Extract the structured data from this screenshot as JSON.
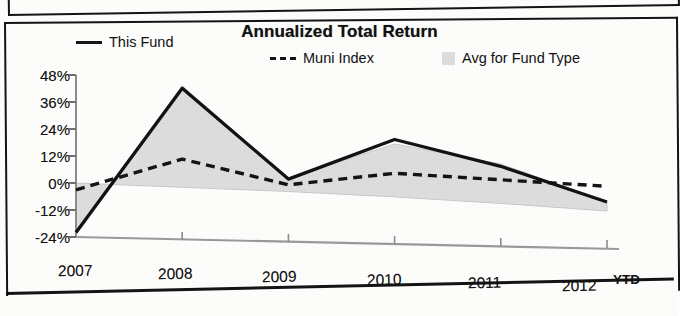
{
  "document": {
    "upper_panel_edge": "partial-panel-border-above",
    "scan_artifact": "photocopied-page"
  },
  "chart_data": {
    "type": "line",
    "title": "Annualized Total Return",
    "xlabel": "",
    "ylabel": "",
    "x": [
      "2007",
      "2008",
      "2009",
      "2010",
      "2011",
      "2012"
    ],
    "x_suffix": "YTD",
    "ylim": [
      -24,
      48
    ],
    "yticks": [
      48,
      36,
      24,
      12,
      0,
      -12,
      -24
    ],
    "ytick_labels": [
      "48%",
      "36%",
      "24%",
      "12%",
      "0%",
      "-12%",
      "-24%"
    ],
    "grid": false,
    "legend_position": "top",
    "series": [
      {
        "name": "This Fund",
        "style": "solid",
        "color": "#151515",
        "values": [
          -22,
          43,
          3.5,
          22,
          11,
          -4
        ]
      },
      {
        "name": "Muni Index",
        "style": "dashed",
        "color": "#151515",
        "values": [
          -3,
          11.5,
          1,
          7,
          5,
          3
        ]
      },
      {
        "name": "Avg for Fund Type",
        "style": "area",
        "color": "#d9d9d9",
        "values": [
          -22,
          44,
          4,
          20,
          12,
          -4
        ],
        "baseline": [
          0,
          -1,
          -2,
          -3.5,
          -5.5,
          -8
        ]
      }
    ]
  },
  "axis": {
    "ytick_labels": [
      "48%",
      "36%",
      "24%",
      "12%",
      "0%",
      "-12%",
      "-24%"
    ],
    "xtick_labels": [
      "2007",
      "2008",
      "2009",
      "2010",
      "2011",
      "2012"
    ],
    "ytd": "YTD"
  },
  "legend": {
    "items": [
      {
        "label": "This Fund",
        "marker": "solid-line-swatch"
      },
      {
        "label": "Muni Index",
        "marker": "dashed-line-swatch"
      },
      {
        "label": "Avg for Fund Type",
        "marker": "gray-area-swatch"
      }
    ]
  }
}
